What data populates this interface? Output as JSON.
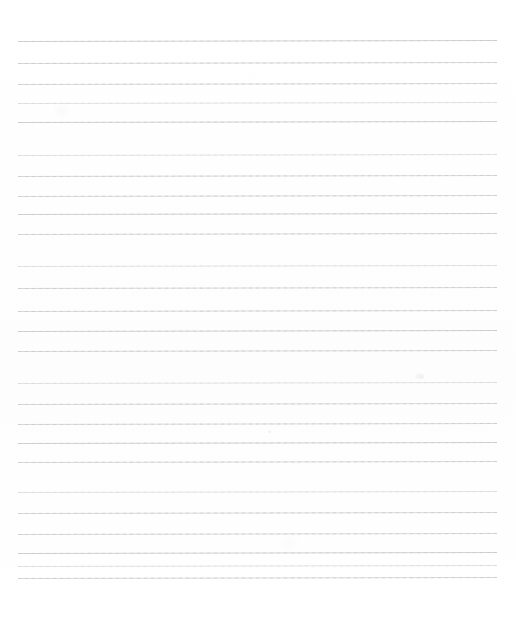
{
  "document": {
    "kind": "scanned-lined-paper",
    "title": "Blank Ruled Notebook Page",
    "page_width": 516,
    "page_height": 617,
    "background_color": "#ffffff",
    "rule_color": "#d9d9d9",
    "rule_color_faint": "#e4e4e4",
    "rule_color_strong": "#d2d2d2",
    "rule_thickness": 1,
    "rule_left_x": 18,
    "rule_right_x": 497,
    "scan_tilt_degrees": -0.12,
    "written_text": "",
    "body_text": "",
    "handwriting_present": false,
    "margin_rule_present": false,
    "header_text": "",
    "footer_text": "",
    "page_number": "",
    "rule_count": 26
  },
  "rules": [
    {
      "index": 1,
      "y": 41,
      "weight": "strong"
    },
    {
      "index": 2,
      "y": 63,
      "weight": "normal"
    },
    {
      "index": 3,
      "y": 84,
      "weight": "normal"
    },
    {
      "index": 4,
      "y": 103,
      "weight": "faint"
    },
    {
      "index": 5,
      "y": 122,
      "weight": "strong"
    },
    {
      "index": 6,
      "y": 155,
      "weight": "faint"
    },
    {
      "index": 7,
      "y": 176,
      "weight": "normal"
    },
    {
      "index": 8,
      "y": 196,
      "weight": "normal"
    },
    {
      "index": 9,
      "y": 214,
      "weight": "strong"
    },
    {
      "index": 10,
      "y": 234,
      "weight": "normal"
    },
    {
      "index": 11,
      "y": 266,
      "weight": "faint"
    },
    {
      "index": 12,
      "y": 288,
      "weight": "normal"
    },
    {
      "index": 13,
      "y": 311,
      "weight": "normal"
    },
    {
      "index": 14,
      "y": 331,
      "weight": "strong"
    },
    {
      "index": 15,
      "y": 351,
      "weight": "normal"
    },
    {
      "index": 16,
      "y": 383,
      "weight": "faint"
    },
    {
      "index": 17,
      "y": 404,
      "weight": "normal"
    },
    {
      "index": 18,
      "y": 424,
      "weight": "normal"
    },
    {
      "index": 19,
      "y": 443,
      "weight": "strong"
    },
    {
      "index": 20,
      "y": 462,
      "weight": "normal"
    },
    {
      "index": 21,
      "y": 492,
      "weight": "faint"
    },
    {
      "index": 22,
      "y": 513,
      "weight": "normal"
    },
    {
      "index": 23,
      "y": 534,
      "weight": "normal"
    },
    {
      "index": 24,
      "y": 553,
      "weight": "strong"
    },
    {
      "index": 25,
      "y": 566,
      "weight": "faint"
    },
    {
      "index": 26,
      "y": 578,
      "weight": "normal"
    }
  ],
  "stray_marks": [
    {
      "x": 419,
      "y": 374,
      "size": 5
    },
    {
      "x": 268,
      "y": 430,
      "size": 3
    }
  ]
}
